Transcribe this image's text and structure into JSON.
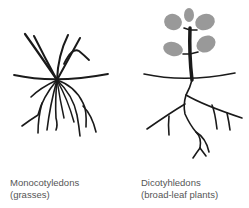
{
  "diagram": {
    "panels": [
      {
        "id": "monocot",
        "title": "Monocotyledons",
        "subtitle": "(grasses)",
        "illustration": "fibrous-root-grass-icon"
      },
      {
        "id": "dicot",
        "title": "Dicotyhledons",
        "subtitle": "(broad-leaf plants)",
        "illustration": "taproot-broadleaf-plant-icon"
      }
    ],
    "colors": {
      "line": "#1a1a1a",
      "leaf": "#999999",
      "text": "#555555",
      "background": "#ffffff"
    }
  }
}
